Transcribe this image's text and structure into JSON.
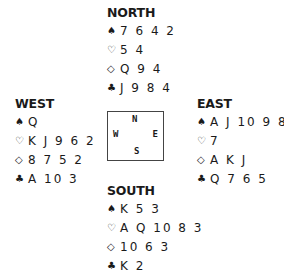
{
  "suits": {
    "spades": "♠",
    "hearts": "♡",
    "diamonds": "◇",
    "clubs": "♣"
  },
  "hands": {
    "north": {
      "title": "NORTH",
      "spades": "7 6 4 2",
      "hearts": "5 4",
      "diamonds": "Q 9 4",
      "clubs": "J 9 8 4"
    },
    "west": {
      "title": "WEST",
      "spades": "Q",
      "hearts": "K J 9 6 2",
      "diamonds": "8 7 5 2",
      "clubs": "A 10 3"
    },
    "east": {
      "title": "EAST",
      "spades": "A J 10 9 8",
      "hearts": "7",
      "diamonds": "A K J",
      "clubs": "Q 7 6 5"
    },
    "south": {
      "title": "SOUTH",
      "spades": "K 5 3",
      "hearts": "A Q 10 8 3",
      "diamonds": "10 6 3",
      "clubs": "K 2"
    }
  },
  "compass": {
    "n": "N",
    "w": "W",
    "e": "E",
    "s": "S"
  }
}
